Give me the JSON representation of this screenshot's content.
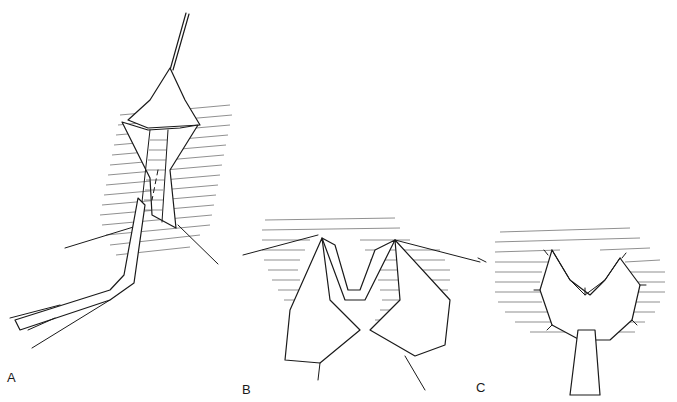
{
  "figure": {
    "type": "surgical-illustration",
    "style": "black ink line drawing with hatching",
    "background": "#ffffff",
    "ink_color": "#1a1a1a",
    "panels": [
      {
        "id": "A",
        "label": "A",
        "description": "Incision opened with retractor; tubular structure dissected, forceps holding tissue flap"
      },
      {
        "id": "B",
        "label": "B",
        "description": "Tissue flaps spread apart with sutures, V-shaped opening"
      },
      {
        "id": "C",
        "label": "C",
        "description": "Tubular structure sutured in place with flaps secured by interrupted sutures"
      }
    ]
  }
}
